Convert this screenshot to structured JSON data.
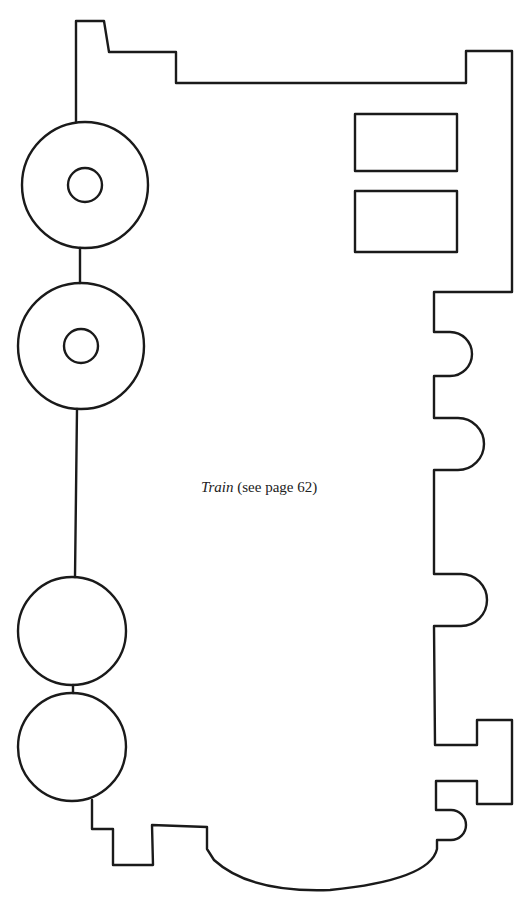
{
  "figure": {
    "caption": {
      "title": "Train",
      "reference": "(see page 62)"
    },
    "stroke_color": "#1a1a1a",
    "background": "#ffffff",
    "parts": {
      "wheels": [
        {
          "name": "wheel-1",
          "cx": 85,
          "cy": 185,
          "r": 63,
          "hub_r": 17
        },
        {
          "name": "wheel-2",
          "cx": 81,
          "cy": 346,
          "r": 63,
          "hub_r": 17
        },
        {
          "name": "wheel-3",
          "cx": 72,
          "cy": 631,
          "r": 54
        },
        {
          "name": "wheel-4",
          "cx": 72,
          "cy": 747,
          "r": 54
        }
      ],
      "windows": [
        {
          "name": "window-1",
          "x": 355,
          "y": 114,
          "w": 102,
          "h": 57
        },
        {
          "name": "window-2",
          "x": 355,
          "y": 191,
          "w": 102,
          "h": 61
        }
      ]
    }
  }
}
